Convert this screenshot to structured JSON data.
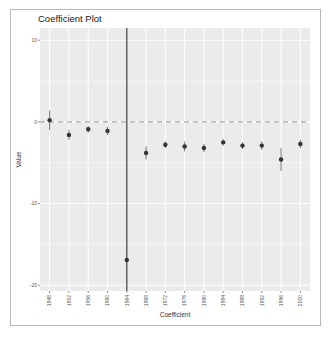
{
  "chart_data": {
    "type": "scatter",
    "subtype": "coefficient-plot-with-error-bars",
    "title": "Coefficient Plot",
    "xlabel": "Coefficient",
    "ylabel": "Value",
    "categories": [
      "1948",
      "1952",
      "1956",
      "1960",
      "1964",
      "1968",
      "1972",
      "1976",
      "1980",
      "1984",
      "1988",
      "1992",
      "1996",
      "2000"
    ],
    "series": [
      {
        "name": "Value",
        "values": [
          0.2,
          -1.6,
          -0.9,
          -1.1,
          -16.9,
          -3.8,
          -2.8,
          -3.0,
          -3.2,
          -2.5,
          -2.9,
          -2.9,
          -4.6,
          -2.7
        ],
        "lower": [
          -1.0,
          -2.2,
          -1.3,
          -1.6,
          -22.0,
          -4.6,
          -3.2,
          -3.6,
          -3.7,
          -2.9,
          -3.3,
          -3.4,
          -6.0,
          -3.2
        ],
        "upper": [
          1.4,
          -1.0,
          -0.5,
          -0.6,
          12.0,
          -3.0,
          -2.4,
          -2.4,
          -2.7,
          -2.1,
          -2.5,
          -2.4,
          -3.2,
          -2.2
        ]
      }
    ],
    "yticks": [
      10,
      0,
      -10,
      -20
    ],
    "ytick_labels": [
      "10",
      "0",
      "-10",
      "-20"
    ],
    "ylim": [
      -20.7,
      11.5
    ],
    "reference_line": {
      "y": 0,
      "style": "dashed"
    },
    "grid": true,
    "legend": "none",
    "colors": {
      "panel_background": "#ebebeb",
      "grid": "#ffffff",
      "point": "#333333",
      "reference_line": "#a6a6a6"
    }
  }
}
